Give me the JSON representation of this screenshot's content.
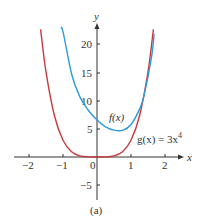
{
  "chart_data": {
    "type": "line",
    "title": "",
    "caption": "(a)",
    "xlabel": "x",
    "ylabel": "y",
    "xlim": [
      -2.4,
      2.5
    ],
    "ylim": [
      -8,
      23
    ],
    "grid": false,
    "x_ticks": [
      -2,
      -1,
      0,
      1,
      2
    ],
    "x_tick_labels": [
      "−2",
      "−1",
      "0",
      "1",
      "2"
    ],
    "y_ticks": [
      -5,
      5,
      10,
      15,
      20
    ],
    "y_tick_labels": [
      "−5",
      "5",
      "10",
      "15",
      "20"
    ],
    "series": [
      {
        "name": "f(x)",
        "label": "f(x)",
        "color": "#2e9bd6",
        "x": [
          -1.06,
          -1.0,
          -0.75,
          -0.5,
          -0.25,
          0.0,
          0.25,
          0.5,
          0.77,
          1.0,
          1.25,
          1.38,
          1.6,
          1.68
        ],
        "values": [
          23.0,
          22.4,
          14.9,
          10.7,
          8.3,
          6.6,
          5.4,
          4.8,
          4.8,
          5.8,
          8.5,
          10.9,
          17.7,
          22.0
        ]
      },
      {
        "name": "g(x) = 3x^4",
        "label": "g(x) = 3x⁴",
        "color": "#c8393d",
        "x": [
          -1.66,
          -1.5,
          -1.25,
          -1.0,
          -0.75,
          -0.5,
          -0.25,
          0.0,
          0.25,
          0.5,
          0.75,
          1.0,
          1.25,
          1.5,
          1.66
        ],
        "values": [
          22.8,
          15.19,
          7.32,
          3.0,
          0.95,
          0.19,
          0.01,
          0.0,
          0.01,
          0.19,
          0.95,
          3.0,
          7.32,
          15.19,
          22.8
        ]
      }
    ],
    "annotations": [
      {
        "text": "f(x)",
        "x": 0.45,
        "y": 7.2
      },
      {
        "text": "g(x) = 3x⁴",
        "x": 1.2,
        "y": 2.5
      }
    ]
  },
  "labels": {
    "x_axis": "x",
    "y_axis": "y",
    "caption": "(a)",
    "f_label": "f(x)",
    "g_label_prefix": "g(x) = 3x",
    "g_label_exp": "4",
    "ticks": {
      "xm2": "−2",
      "xm1": "−1",
      "x0": "0",
      "x1": "1",
      "x2": "2",
      "ym5": "−5",
      "y5": "5",
      "y10": "10",
      "y15": "15",
      "y20": "20"
    }
  }
}
